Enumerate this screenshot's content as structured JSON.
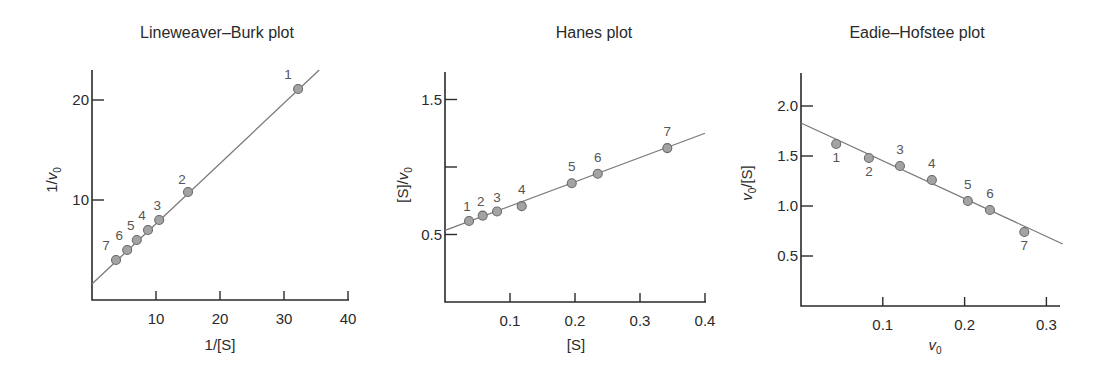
{
  "chart_data": [
    {
      "type": "scatter",
      "title": "Lineweaver–Burk plot",
      "xlabel": "1/[S]",
      "ylabel": "1/v0",
      "xlim": [
        0,
        40
      ],
      "ylim": [
        0,
        22
      ],
      "xticks": [
        10,
        20,
        30,
        40
      ],
      "yticks": [
        10,
        20
      ],
      "grid": false,
      "legend": "none",
      "points": [
        {
          "label": "1",
          "x": 32.2,
          "y": 21.1
        },
        {
          "label": "2",
          "x": 15.0,
          "y": 10.8
        },
        {
          "label": "3",
          "x": 10.5,
          "y": 8.0
        },
        {
          "label": "4",
          "x": 8.75,
          "y": 7.0
        },
        {
          "label": "5",
          "x": 7.0,
          "y": 6.0
        },
        {
          "label": "6",
          "x": 5.5,
          "y": 5.0
        },
        {
          "label": "7",
          "x": 3.75,
          "y": 4.0
        }
      ],
      "fit_line": {
        "x0": 0,
        "y0": 1.6,
        "x1": 35.5,
        "y1": 23.0
      }
    },
    {
      "type": "scatter",
      "title": "Hanes plot",
      "xlabel": "[S]",
      "ylabel": "[S]/v0",
      "xlim": [
        0,
        0.4
      ],
      "ylim": [
        0,
        1.7
      ],
      "xticks": [
        0.1,
        0.2,
        0.3,
        0.4
      ],
      "yticks": [
        0.5,
        1.0,
        1.5
      ],
      "ytick_labels": [
        "0.5",
        "",
        "1.5"
      ],
      "grid": false,
      "legend": "none",
      "points": [
        {
          "label": "1",
          "x": 0.037,
          "y": 0.6
        },
        {
          "label": "2",
          "x": 0.058,
          "y": 0.64
        },
        {
          "label": "3",
          "x": 0.08,
          "y": 0.67
        },
        {
          "label": "4",
          "x": 0.118,
          "y": 0.71
        },
        {
          "label": "5",
          "x": 0.195,
          "y": 0.88
        },
        {
          "label": "6",
          "x": 0.235,
          "y": 0.95
        },
        {
          "label": "7",
          "x": 0.342,
          "y": 1.14
        }
      ],
      "fit_line": {
        "x0": 0,
        "y0": 0.53,
        "x1": 0.4,
        "y1": 1.25
      }
    },
    {
      "type": "scatter",
      "title": "Eadie–Hofstee plot",
      "xlabel": "v0",
      "ylabel": "v0/[S]",
      "xlim": [
        0,
        0.32
      ],
      "ylim": [
        0,
        2.3
      ],
      "xticks": [
        0.1,
        0.2,
        0.3
      ],
      "yticks": [
        0.5,
        1.0,
        1.5,
        2.0
      ],
      "grid": false,
      "legend": "none",
      "points": [
        {
          "label": "1",
          "x": 0.043,
          "y": 1.62
        },
        {
          "label": "2",
          "x": 0.083,
          "y": 1.48
        },
        {
          "label": "3",
          "x": 0.121,
          "y": 1.4
        },
        {
          "label": "4",
          "x": 0.16,
          "y": 1.26
        },
        {
          "label": "5",
          "x": 0.204,
          "y": 1.05
        },
        {
          "label": "6",
          "x": 0.231,
          "y": 0.96
        },
        {
          "label": "7",
          "x": 0.273,
          "y": 0.74
        }
      ],
      "fit_line": {
        "x0": 0,
        "y0": 1.83,
        "x1": 0.32,
        "y1": 0.62
      }
    }
  ],
  "panels": [
    {
      "title": "Lineweaver–Burk plot",
      "xlabel": "1/[S]",
      "ylabel_pre": "1/",
      "ylabel_var": "v",
      "ylabel_sub": "0",
      "ylabel_post": ""
    },
    {
      "title": "Hanes plot",
      "xlabel": "[S]",
      "ylabel_pre": "[S]/",
      "ylabel_var": "v",
      "ylabel_sub": "0",
      "ylabel_post": ""
    },
    {
      "title": "Eadie–Hofstee plot",
      "xlabel_var": "v",
      "xlabel_sub": "0",
      "ylabel_pre": "",
      "ylabel_var": "v",
      "ylabel_sub": "0",
      "ylabel_post": "/[S]"
    }
  ]
}
